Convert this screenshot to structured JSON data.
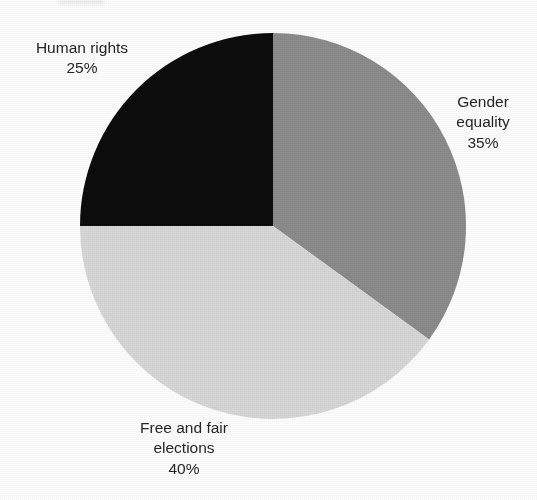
{
  "chart_data": {
    "type": "pie",
    "title": "",
    "categories": [
      "Gender equality",
      "Free and fair elections",
      "Human rights"
    ],
    "values": [
      35,
      40,
      25
    ],
    "unit": "%",
    "legend": "none",
    "labels_position": "outside",
    "start_angle_deg": 0,
    "direction": "clockwise",
    "slices": [
      {
        "name": "gender-equality",
        "label": "Gender equality",
        "label_lines": [
          "Gender",
          "equality"
        ],
        "value": 35,
        "value_text": "35%",
        "color": "#8c8c8c",
        "start_deg": 0,
        "end_deg": 126
      },
      {
        "name": "free-and-fair-elections",
        "label": "Free and fair elections",
        "label_lines": [
          "Free and fair",
          "elections"
        ],
        "value": 40,
        "value_text": "40%",
        "color": "#d8d8d8",
        "start_deg": 126,
        "end_deg": 270
      },
      {
        "name": "human-rights",
        "label": "Human rights",
        "label_lines": [
          "Human rights"
        ],
        "value": 25,
        "value_text": "25%",
        "color": "#0c0c0c",
        "start_deg": 270,
        "end_deg": 360
      }
    ],
    "geometry": {
      "center_x": 273,
      "center_y": 226,
      "radius": 193
    },
    "background_color": "#ffffff",
    "text_color": "#262626"
  }
}
